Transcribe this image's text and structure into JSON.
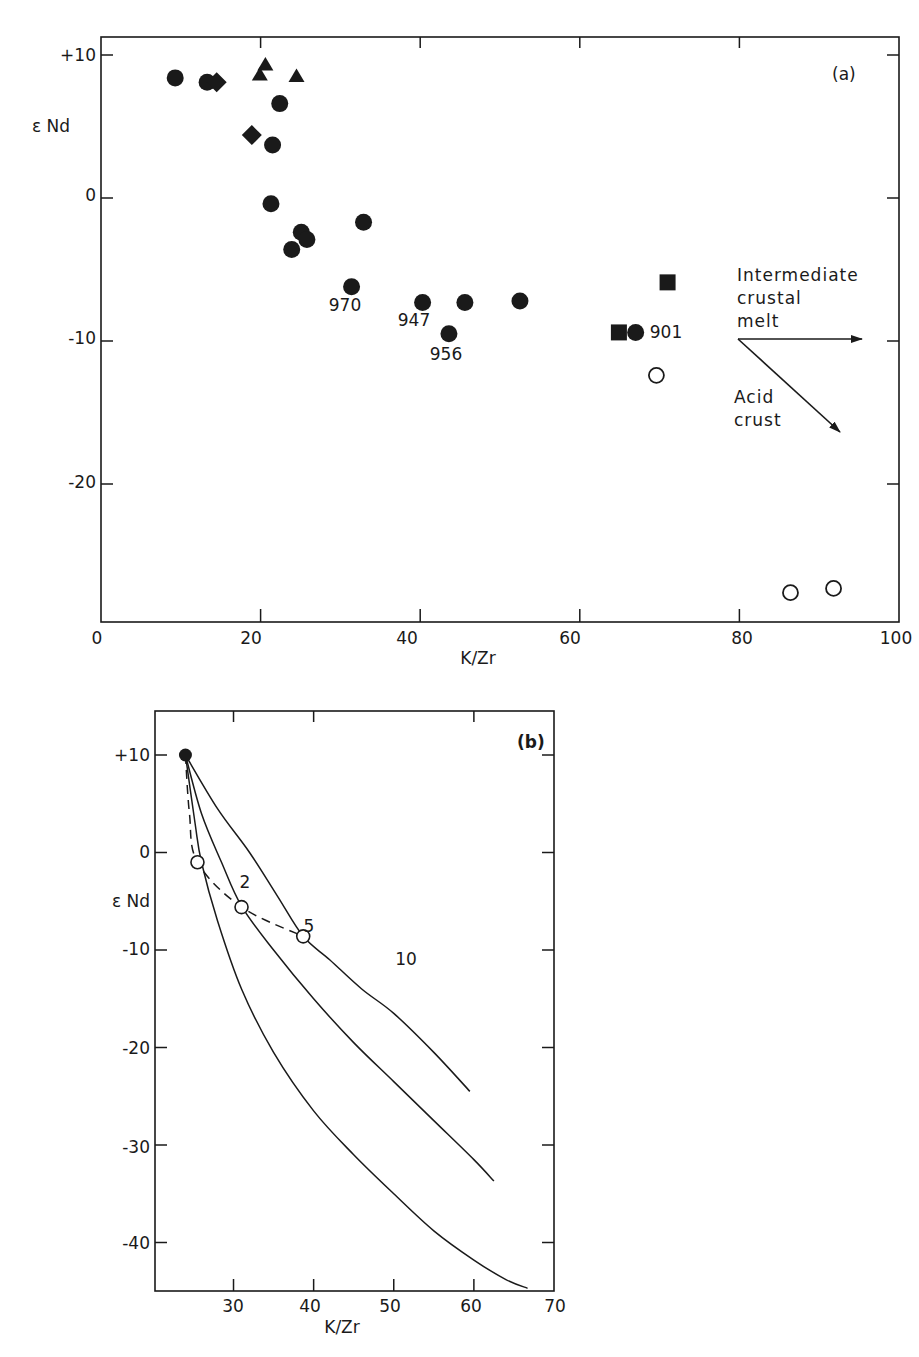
{
  "figure": {
    "panel_a": {
      "tag": "(a)",
      "ylabel": "ε Nd",
      "xlabel": "K/Zr",
      "xticks": [
        "0",
        "20",
        "40",
        "60",
        "80",
        "100"
      ],
      "yticks": [
        "+10",
        "0",
        "-10",
        "-20"
      ],
      "sample_labels": [
        "970",
        "947",
        "956",
        "901"
      ],
      "arrow_labels": {
        "intermediate_1": "Intermediate",
        "intermediate_2": "crustal",
        "intermediate_3": "melt",
        "acid_1": "Acid",
        "acid_2": "crust"
      }
    },
    "panel_b": {
      "tag": "(b)",
      "ylabel": "ε Nd",
      "xlabel": "K/Zr",
      "xticks": [
        "30",
        "40",
        "50",
        "60",
        "70"
      ],
      "yticks": [
        "+10",
        "0",
        "-10",
        "-20",
        "-30",
        "-40"
      ],
      "point_labels": [
        "2",
        "5",
        "10"
      ]
    }
  },
  "chart_data": [
    {
      "type": "scatter",
      "title": "(a)",
      "xlabel": "K/Zr",
      "ylabel": "ε Nd",
      "xlim": [
        0,
        100
      ],
      "ylim": [
        -30,
        12
      ],
      "grid": false,
      "series": [
        {
          "name": "filled circles",
          "marker": "filled-circle",
          "points": [
            {
              "x": 9.3,
              "y": 8.4
            },
            {
              "x": 13.3,
              "y": 8.1
            },
            {
              "x": 22.4,
              "y": 6.6
            },
            {
              "x": 21.5,
              "y": 3.7
            },
            {
              "x": 21.3,
              "y": -0.4
            },
            {
              "x": 25.1,
              "y": -2.4
            },
            {
              "x": 25.8,
              "y": -2.9
            },
            {
              "x": 23.9,
              "y": -3.6
            },
            {
              "x": 32.9,
              "y": -1.7
            },
            {
              "x": 31.4,
              "y": -6.2,
              "label": "970"
            },
            {
              "x": 40.3,
              "y": -7.3,
              "label": "947"
            },
            {
              "x": 43.6,
              "y": -9.5,
              "label": "956"
            },
            {
              "x": 45.6,
              "y": -7.3
            },
            {
              "x": 52.5,
              "y": -7.2
            },
            {
              "x": 67.0,
              "y": -9.4,
              "label": "901"
            }
          ]
        },
        {
          "name": "filled diamonds",
          "marker": "filled-diamond",
          "points": [
            {
              "x": 14.5,
              "y": 8.1
            },
            {
              "x": 18.9,
              "y": 4.4
            }
          ]
        },
        {
          "name": "filled triangles",
          "marker": "filled-triangle",
          "points": [
            {
              "x": 20.6,
              "y": 9.3
            },
            {
              "x": 19.9,
              "y": 8.6
            },
            {
              "x": 24.5,
              "y": 8.5
            }
          ]
        },
        {
          "name": "filled squares",
          "marker": "filled-square",
          "points": [
            {
              "x": 71.0,
              "y": -5.9
            },
            {
              "x": 64.9,
              "y": -9.4
            }
          ]
        },
        {
          "name": "open circles",
          "marker": "open-circle",
          "points": [
            {
              "x": 69.6,
              "y": -12.4
            },
            {
              "x": 86.4,
              "y": -27.6
            },
            {
              "x": 91.8,
              "y": -27.3
            }
          ]
        }
      ],
      "annotations": [
        {
          "text": "Intermediate crustal melt",
          "arrow_from": [
            80,
            -10
          ],
          "arrow_to": [
            96,
            -10
          ]
        },
        {
          "text": "Acid crust",
          "arrow_from": [
            80,
            -10
          ],
          "arrow_to": [
            93,
            -16.7
          ]
        }
      ]
    },
    {
      "type": "line",
      "title": "(b)",
      "xlabel": "K/Zr",
      "ylabel": "ε Nd",
      "xlim": [
        20,
        70
      ],
      "ylim": [
        -45,
        14.5
      ],
      "grid": false,
      "start_point": {
        "x": 24,
        "y": 10
      },
      "series": [
        {
          "name": "curve through 2",
          "style": "solid",
          "points": [
            [
              24,
              10
            ],
            [
              25.2,
              3
            ],
            [
              26,
              -1
            ],
            [
              28,
              -7
            ],
            [
              31,
              -14
            ],
            [
              35,
              -20.5
            ],
            [
              40,
              -26.5
            ],
            [
              45,
              -31
            ],
            [
              50,
              -35
            ],
            [
              55,
              -38.8
            ],
            [
              60,
              -41.8
            ],
            [
              64,
              -43.8
            ],
            [
              66.7,
              -44.7
            ]
          ]
        },
        {
          "name": "curve through 5",
          "style": "solid",
          "points": [
            [
              24,
              10
            ],
            [
              26,
              4
            ],
            [
              28.5,
              -1
            ],
            [
              31,
              -5.5
            ],
            [
              35,
              -10
            ],
            [
              40,
              -15
            ],
            [
              45,
              -19.5
            ],
            [
              50,
              -23.5
            ],
            [
              55,
              -27.5
            ],
            [
              60,
              -31.5
            ],
            [
              62.5,
              -33.7
            ]
          ]
        },
        {
          "name": "curve through 10",
          "style": "solid",
          "points": [
            [
              24,
              10
            ],
            [
              28,
              4.5
            ],
            [
              32,
              0
            ],
            [
              35.5,
              -4.5
            ],
            [
              38.7,
              -8.6
            ],
            [
              42,
              -11
            ],
            [
              46,
              -14
            ],
            [
              50,
              -16.5
            ],
            [
              55,
              -20.5
            ],
            [
              59.5,
              -24.5
            ]
          ]
        },
        {
          "name": "mixing trajectory",
          "style": "dashed",
          "points": [
            [
              24,
              10
            ],
            [
              24.5,
              4
            ],
            [
              25.5,
              -1
            ],
            [
              31,
              -5.6
            ],
            [
              38.7,
              -8.6
            ]
          ]
        }
      ],
      "labeled_points": [
        {
          "label": "2",
          "x": 25.5,
          "y": -1.0
        },
        {
          "label": "5",
          "x": 31.0,
          "y": -5.6
        },
        {
          "label": "10",
          "x": 38.7,
          "y": -8.6
        }
      ]
    }
  ]
}
